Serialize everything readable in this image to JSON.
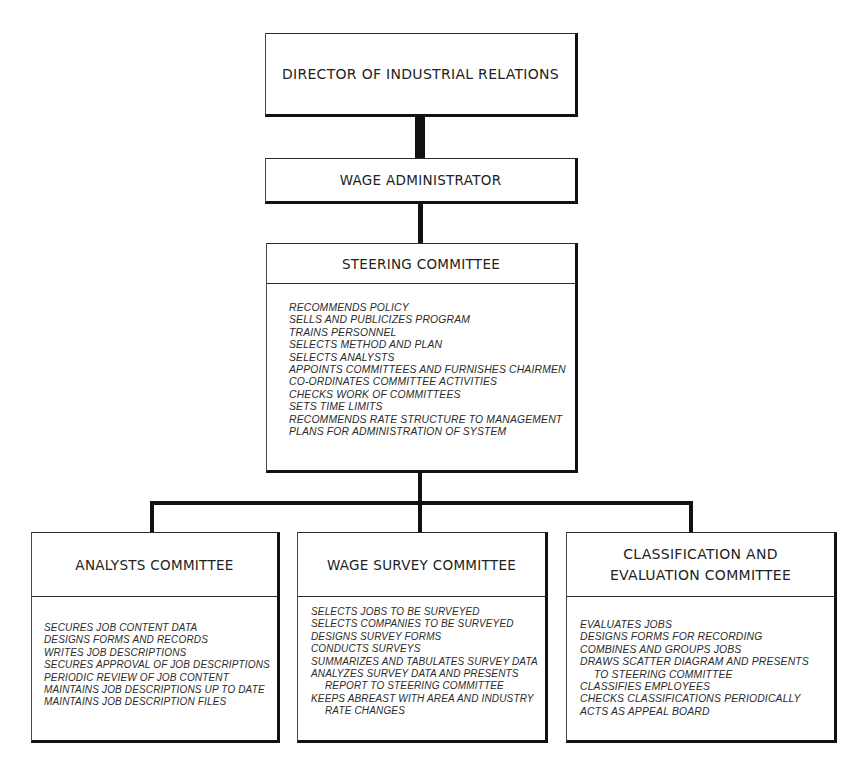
{
  "chart": {
    "top": {
      "director": {
        "title": "DIRECTOR OF INDUSTRIAL RELATIONS"
      },
      "wage_administrator": {
        "title": "WAGE ADMINISTRATOR"
      }
    },
    "steering_committee": {
      "title": "STEERING COMMITTEE",
      "duties": [
        "RECOMMENDS POLICY",
        "SELLS AND PUBLICIZES PROGRAM",
        "TRAINS PERSONNEL",
        "SELECTS METHOD AND PLAN",
        "SELECTS ANALYSTS",
        "APPOINTS COMMITTEES AND FURNISHES CHAIRMEN",
        "CO-ORDINATES COMMITTEE ACTIVITIES",
        "CHECKS WORK OF COMMITTEES",
        "SETS TIME LIMITS",
        "RECOMMENDS RATE STRUCTURE TO MANAGEMENT",
        "PLANS FOR ADMINISTRATION OF SYSTEM"
      ]
    },
    "committees": [
      {
        "title": "ANALYSTS COMMITTEE",
        "duties": [
          "SECURES JOB CONTENT DATA",
          "DESIGNS FORMS AND RECORDS",
          "WRITES JOB DESCRIPTIONS",
          "SECURES APPROVAL OF JOB DESCRIPTIONS",
          "PERIODIC REVIEW OF JOB CONTENT",
          "MAINTAINS JOB DESCRIPTIONS UP TO DATE",
          "MAINTAINS JOB DESCRIPTION FILES"
        ]
      },
      {
        "title": "WAGE SURVEY COMMITTEE",
        "duties": [
          "SELECTS JOBS TO BE SURVEYED",
          "SELECTS COMPANIES TO BE SURVEYED",
          "DESIGNS SURVEY FORMS",
          "CONDUCTS SURVEYS",
          "SUMMARIZES AND TABULATES SURVEY DATA",
          "ANALYZES SURVEY DATA AND PRESENTS",
          "REPORT TO STEERING COMMITTEE",
          "KEEPS ABREAST WITH AREA AND INDUSTRY",
          "RATE CHANGES"
        ]
      },
      {
        "title_line1": "CLASSIFICATION AND",
        "title_line2": "EVALUATION COMMITTEE",
        "duties": [
          "EVALUATES JOBS",
          "DESIGNS FORMS FOR RECORDING",
          "COMBINES AND GROUPS JOBS",
          "DRAWS SCATTER DIAGRAM AND PRESENTS",
          "TO STEERING COMMITTEE",
          "CLASSIFIES EMPLOYEES",
          "CHECKS CLASSIFICATIONS PERIODICALLY",
          "ACTS AS APPEAL BOARD"
        ]
      }
    ]
  }
}
